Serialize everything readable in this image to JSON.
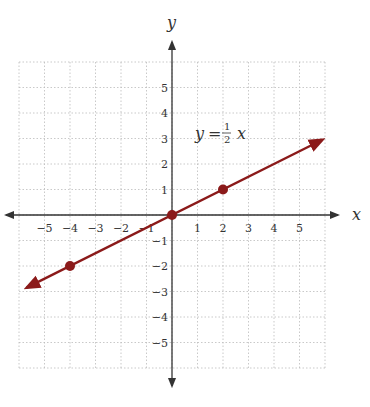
{
  "chart_data": {
    "type": "line",
    "title": "",
    "equation": "y = 1/2 x",
    "equation_parts": {
      "lhs": "y",
      "eq": "=",
      "num": "1",
      "den": "2",
      "var": "x"
    },
    "xlabel": "x",
    "ylabel": "y",
    "xlim": [
      -6,
      6
    ],
    "ylim": [
      -6,
      6
    ],
    "grid": true,
    "x_ticks": [
      "−5",
      "−4",
      "−3",
      "−2",
      "−1",
      "1",
      "2",
      "3",
      "4",
      "5"
    ],
    "y_ticks": [
      "5",
      "4",
      "3",
      "2",
      "1",
      "−1",
      "−2",
      "−3",
      "−4",
      "−5"
    ],
    "series": [
      {
        "name": "y = 1/2 x",
        "slope": 0.5,
        "intercept": 0,
        "color": "#8b1a1a",
        "x": [
          -6,
          6
        ],
        "y": [
          -3,
          3
        ]
      }
    ],
    "points": [
      {
        "x": -4,
        "y": -2
      },
      {
        "x": 0,
        "y": 0
      },
      {
        "x": 2,
        "y": 1
      }
    ]
  },
  "colors": {
    "line": "#8b1a1a",
    "axis": "#333333",
    "grid": "#bbbbbb"
  }
}
